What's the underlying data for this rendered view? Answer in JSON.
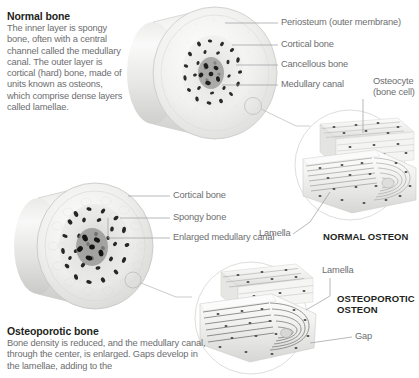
{
  "figure": {
    "background_color": "#ffffff",
    "label_color": "#6d6e70",
    "heading_color": "#231f20",
    "leader_line_color": "#9a9b9d"
  },
  "blocks": [
    {
      "id": "normal-bone",
      "title": "Normal bone",
      "body": "The inner layer is spongy bone, often with a central channel called the medullary canal. The outer layer is cortical (hard) bone, made of units known as osteons, which comprise dense layers called lamellae."
    },
    {
      "id": "osteoporotic-bone",
      "title": "Osteoporotic bone",
      "body": "Bone density is reduced, and the medullary canal, through the center, is enlarged. Gaps develop in the lamellae, adding to the"
    }
  ],
  "labels": {
    "periosteum": "Periosteum (outer membrane)",
    "cortical_bone_top": "Cortical bone",
    "cancellous_bone": "Cancellous bone",
    "medullary_canal": "Medullary canal",
    "osteocyte": "Osteocyte (bone cell)",
    "lamella_normal": "Lamella",
    "cortical_bone_bottom": "Cortical bone",
    "spongy_bone": "Spongy bone",
    "enlarged_medullary_canal": "Enlarged medullary canal",
    "lamella_osteoporotic": "Lamella",
    "gap": "Gap"
  },
  "headings": {
    "normal_osteon": "NORMAL OSTEON",
    "osteoporotic_osteon": "OSTEOPOROTIC OSTEON"
  },
  "diagram_meta": {
    "type": "anatomical-illustration",
    "subject": "bone cross-section comparison",
    "panels": [
      "normal bone cylinder cross-section",
      "normal osteon magnification",
      "osteoporotic bone cylinder cross-section",
      "osteoporotic osteon magnification"
    ]
  }
}
